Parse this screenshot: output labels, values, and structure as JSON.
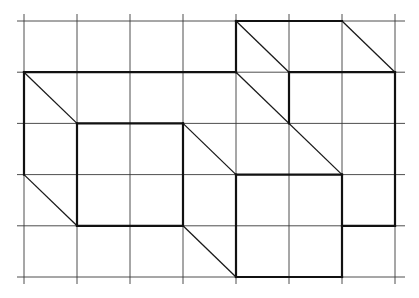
{
  "diagram": {
    "type": "grid-figure",
    "grid": {
      "columns": 7,
      "rows": 5
    },
    "colors": {
      "grid": "#3a3a3a",
      "outline": "#111111",
      "diagonal": "#1a1a1a",
      "background": "#ffffff"
    },
    "heavy_segments": [
      [
        [
          0,
          1
        ],
        [
          4,
          1
        ]
      ],
      [
        [
          0,
          1
        ],
        [
          0,
          3
        ]
      ],
      [
        [
          1,
          2
        ],
        [
          3,
          2
        ]
      ],
      [
        [
          1,
          2
        ],
        [
          1,
          4
        ]
      ],
      [
        [
          3,
          2
        ],
        [
          3,
          4
        ]
      ],
      [
        [
          1,
          4
        ],
        [
          3,
          4
        ]
      ],
      [
        [
          4,
          0
        ],
        [
          4,
          1
        ]
      ],
      [
        [
          4,
          0
        ],
        [
          6,
          0
        ]
      ],
      [
        [
          5,
          1
        ],
        [
          7,
          1
        ]
      ],
      [
        [
          5,
          1
        ],
        [
          5,
          2
        ]
      ],
      [
        [
          7,
          1
        ],
        [
          7,
          4
        ]
      ],
      [
        [
          6,
          4
        ],
        [
          7,
          4
        ]
      ],
      [
        [
          4,
          3
        ],
        [
          6,
          3
        ]
      ],
      [
        [
          4,
          3
        ],
        [
          4,
          5
        ]
      ],
      [
        [
          6,
          3
        ],
        [
          6,
          5
        ]
      ],
      [
        [
          4,
          5
        ],
        [
          6,
          5
        ]
      ]
    ],
    "diagonal_segments": [
      [
        [
          0,
          1
        ],
        [
          1,
          2
        ]
      ],
      [
        [
          0,
          3
        ],
        [
          1,
          4
        ]
      ],
      [
        [
          3,
          2
        ],
        [
          4,
          3
        ]
      ],
      [
        [
          3,
          4
        ],
        [
          4,
          5
        ]
      ],
      [
        [
          4,
          0
        ],
        [
          5,
          1
        ]
      ],
      [
        [
          6,
          0
        ],
        [
          7,
          1
        ]
      ],
      [
        [
          4,
          1
        ],
        [
          6,
          3
        ]
      ]
    ]
  }
}
